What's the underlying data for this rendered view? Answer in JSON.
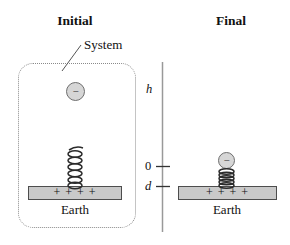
{
  "figure": {
    "initial_title": "Initial",
    "final_title": "Final",
    "system_label": "System",
    "axis": {
      "h": "h",
      "zero": "0",
      "d": "d"
    },
    "initial": {
      "charge_symbol": "−",
      "plate_charges": "+ + + +",
      "earth_label": "Earth"
    },
    "final": {
      "charge_symbol": "−",
      "plate_charges": "+ + + +",
      "earth_label": "Earth"
    },
    "colors": {
      "ball_fill": "#d6d6d6",
      "ball_stroke": "#6e6e6e",
      "plate_fill": "#c9c9c9",
      "plate_stroke": "#4d4d4d",
      "spring_stroke": "#2b2b2b",
      "axis_line": "#999999",
      "tick": "#333333",
      "system_border": "#8a8a8a",
      "text": "#111111"
    }
  }
}
